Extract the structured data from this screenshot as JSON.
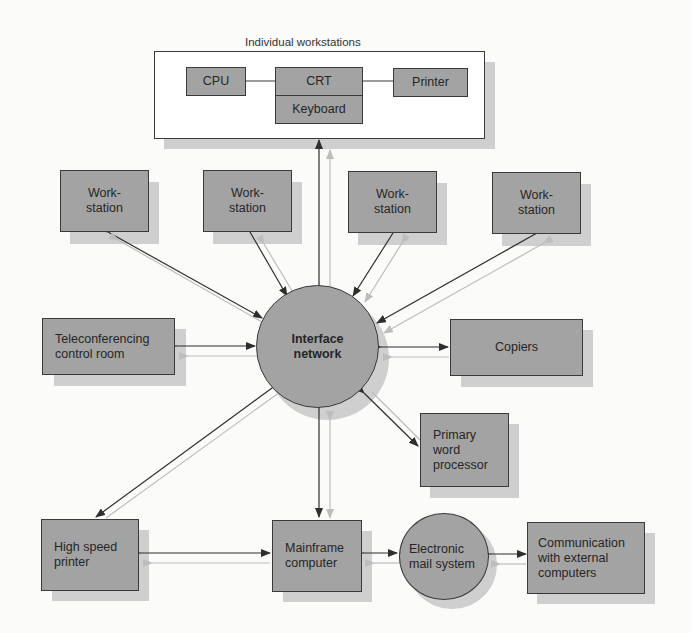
{
  "title": "Individual workstations",
  "workstation_unit": {
    "cpu": "CPU",
    "crt": "CRT",
    "keyboard": "Keyboard",
    "printer": "Printer"
  },
  "hub": {
    "label": "Interface\nnetwork"
  },
  "workstations": [
    {
      "label": "Work-\nstation"
    },
    {
      "label": "Work-\nstation"
    },
    {
      "label": "Work-\nstation"
    },
    {
      "label": "Work-\nstation"
    }
  ],
  "peripherals": {
    "teleconferencing": "Teleconferencing\ncontrol room",
    "copiers": "Copiers",
    "word_processor": "Primary\nword\nprocessor",
    "high_speed_printer": "High speed\nprinter",
    "mainframe": "Mainframe\ncomputer",
    "email": "Electronic\nmail system",
    "external": "Communication\nwith external\ncomputers"
  },
  "colors": {
    "box_fill": "#a3a3a3",
    "shadow": "#cfcfcf",
    "arrow_dark": "#2e2e2e",
    "arrow_light": "#bdbdbd"
  }
}
